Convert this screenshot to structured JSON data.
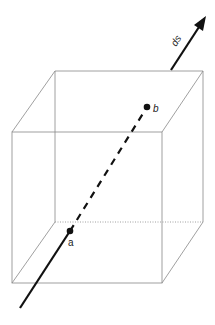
{
  "diagram": {
    "type": "cube with line segment passing through",
    "labels": {
      "a": "a",
      "b": "b",
      "ds": "ds"
    },
    "colors": {
      "cube_edge": "#888888",
      "line": "#111111",
      "background": "#ffffff"
    },
    "points": {
      "a": [
        70,
        231
      ],
      "b": [
        147,
        107
      ]
    }
  }
}
